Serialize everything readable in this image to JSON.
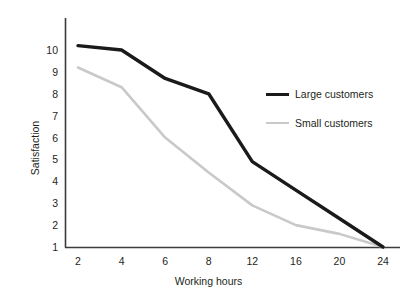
{
  "chart_data": {
    "type": "line",
    "title": "",
    "xlabel": "Working hours",
    "ylabel": "Satisfaction",
    "categories": [
      "2",
      "4",
      "6",
      "8",
      "12",
      "16",
      "20",
      "24"
    ],
    "x": [
      2,
      4,
      6,
      8,
      12,
      16,
      20,
      24
    ],
    "x_spacing": "categorical",
    "xtick_labels": [
      "2",
      "4",
      "6",
      "8",
      "12",
      "16",
      "20",
      "24"
    ],
    "ytick_labels": [
      "1",
      "2",
      "3",
      "4",
      "5",
      "6",
      "7",
      "8",
      "9",
      "10"
    ],
    "ylim": [
      1,
      10
    ],
    "grid": false,
    "legend_position": "top-right",
    "series": [
      {
        "name": "Large customers",
        "color": "#1a1a1a",
        "line_width": 3,
        "values": [
          10.2,
          10.0,
          8.7,
          8.0,
          4.9,
          3.6,
          2.3,
          1.0
        ]
      },
      {
        "name": "Small customers",
        "color": "#c9c9c9",
        "line_width": 2,
        "values": [
          9.2,
          8.3,
          6.0,
          4.4,
          2.9,
          2.0,
          1.6,
          1.0
        ]
      }
    ]
  },
  "axes": {
    "x_title": "Working hours",
    "y_title": "Satisfaction",
    "axis_color": "#3b3b3b"
  },
  "legend": {
    "entries": [
      {
        "label": "Large customers",
        "swatch": "line-dark-thick"
      },
      {
        "label": "Small customers",
        "swatch": "line-gray-thin"
      }
    ]
  }
}
